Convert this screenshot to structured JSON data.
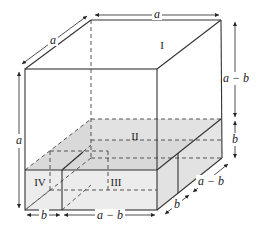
{
  "figure": {
    "regions": [
      {
        "id": "I",
        "label": "I"
      },
      {
        "id": "II",
        "label": "II"
      },
      {
        "id": "III",
        "label": "III"
      },
      {
        "id": "IV",
        "label": "IV"
      }
    ],
    "dimensions": {
      "top_width": "a",
      "top_depth": "a",
      "left_height": "a",
      "right_upper_height": "a − b",
      "right_lower_height": "b",
      "bottom_left_width": "b",
      "bottom_right_width": "a − b",
      "depth_front": "b",
      "depth_back": "a − b"
    },
    "colors": {
      "line": "#333333",
      "shade_top": "#dcdcdc",
      "shade_side": "#e4e4e4",
      "shade_front": "#ececec"
    }
  }
}
